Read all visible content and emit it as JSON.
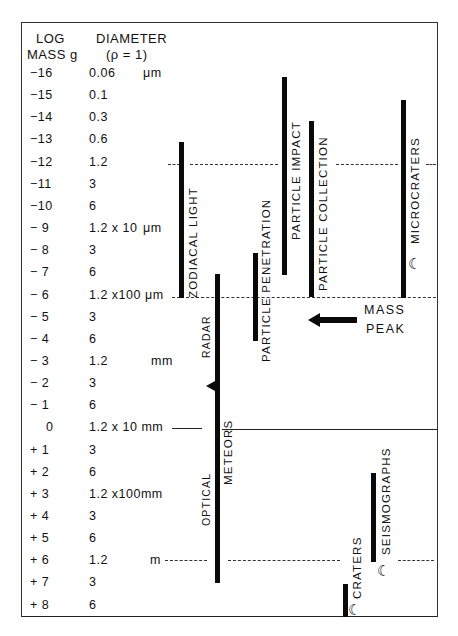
{
  "header": {
    "mass_title_line1": "LOG",
    "mass_title_line2": "MASS g",
    "diameter_title_line1": "DIAMETER",
    "diameter_title_line2": "(ρ = 1)"
  },
  "rows": [
    {
      "mass": "−16",
      "diameter": "0.06",
      "unit": "μm"
    },
    {
      "mass": "−15",
      "diameter": "0.1",
      "unit": ""
    },
    {
      "mass": "−14",
      "diameter": "0.3",
      "unit": ""
    },
    {
      "mass": "−13",
      "diameter": "0.6",
      "unit": ""
    },
    {
      "mass": "−12",
      "diameter": "1.2",
      "unit": ""
    },
    {
      "mass": "−11",
      "diameter": "3",
      "unit": ""
    },
    {
      "mass": "−10",
      "diameter": "6",
      "unit": ""
    },
    {
      "mass": "− 9",
      "diameter": "1.2 x 10",
      "unit": "μm"
    },
    {
      "mass": "− 8",
      "diameter": "3",
      "unit": ""
    },
    {
      "mass": "− 7",
      "diameter": "6",
      "unit": ""
    },
    {
      "mass": "− 6",
      "diameter": "1.2 x100 μm",
      "unit": ""
    },
    {
      "mass": "− 5",
      "diameter": "3",
      "unit": ""
    },
    {
      "mass": "− 4",
      "diameter": "6",
      "unit": ""
    },
    {
      "mass": "− 3",
      "diameter": "1.2",
      "unit": "mm"
    },
    {
      "mass": "− 2",
      "diameter": "3",
      "unit": ""
    },
    {
      "mass": "− 1",
      "diameter": "6",
      "unit": ""
    },
    {
      "mass": "0",
      "diameter": "1.2 x 10 mm",
      "unit": ""
    },
    {
      "mass": "+ 1",
      "diameter": "3",
      "unit": ""
    },
    {
      "mass": "+ 2",
      "diameter": "6",
      "unit": ""
    },
    {
      "mass": "+ 3",
      "diameter": "1.2 x100mm",
      "unit": ""
    },
    {
      "mass": "+ 4",
      "diameter": "3",
      "unit": ""
    },
    {
      "mass": "+ 5",
      "diameter": "6",
      "unit": ""
    },
    {
      "mass": "+ 6",
      "diameter": "1.2",
      "unit": "m"
    },
    {
      "mass": "+ 7",
      "diameter": "3",
      "unit": ""
    },
    {
      "mass": "+ 8",
      "diameter": "6",
      "unit": ""
    }
  ],
  "methods": {
    "zodiacal_light": {
      "label": "ZODIACAL  LIGHT",
      "log_mass_range": [
        -13,
        -6
      ]
    },
    "particle_penetration": {
      "label": "PARTICLE  PENETRATION",
      "log_mass_range": [
        -7.5,
        -4.5
      ]
    },
    "particle_impact": {
      "label": "PARTICLE  IMPACT",
      "log_mass_range": [
        -16.5,
        -7.3
      ]
    },
    "particle_collection": {
      "label": "PARTICLE  COLLECTION",
      "log_mass_range": [
        -12.5,
        -6
      ]
    },
    "microcraters": {
      "label": "MICROCRATERS",
      "log_mass_range": [
        -12.8,
        -6
      ]
    },
    "meteors": {
      "label": "METEORS",
      "log_mass_range": [
        -5.9,
        7.2
      ]
    },
    "radar": {
      "label": "RADAR"
    },
    "optical": {
      "label": "OPTICAL"
    },
    "seismographs": {
      "label": "SEISMOGRAPHS",
      "log_mass_range": [
        2.8,
        6.8
      ]
    },
    "craters": {
      "label": "CRATERS",
      "log_mass_range": [
        6.9,
        8.5
      ]
    }
  },
  "annotations": {
    "mass_peak_line1": "MASS",
    "mass_peak_line2": "PEAK",
    "moon_symbol": "☾"
  }
}
